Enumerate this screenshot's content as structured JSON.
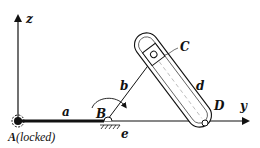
{
  "diagram": {
    "type": "mechanism-schematic",
    "axes": {
      "z": {
        "label": "z"
      },
      "y": {
        "label": "y"
      }
    },
    "points": {
      "A": {
        "label": "A",
        "note": "(locked)"
      },
      "B": {
        "label": "B"
      },
      "C": {
        "label": "C"
      },
      "D": {
        "label": "D"
      }
    },
    "links": {
      "a": {
        "label": "a"
      },
      "b": {
        "label": "b"
      },
      "d": {
        "label": "d"
      },
      "e": {
        "label": "e"
      }
    },
    "colors": {
      "stroke": "#111111",
      "background": "#ffffff",
      "centerline": "#9a9a9a"
    }
  }
}
